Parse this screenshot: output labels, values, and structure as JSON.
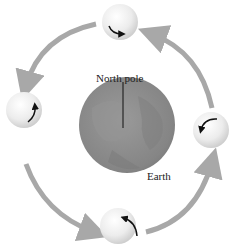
{
  "diagram": {
    "labels": {
      "north_pole": "North pole",
      "earth": "Earth"
    },
    "earth": {
      "color": "#8a8a8a",
      "center": [
        127,
        125
      ],
      "radius": 48
    },
    "moons": [
      {
        "position": "top",
        "center": [
          120,
          22
        ],
        "rotation_arrow": "counterclockwise"
      },
      {
        "position": "left",
        "center": [
          24,
          110
        ],
        "rotation_arrow": "counterclockwise"
      },
      {
        "position": "bottom",
        "center": [
          118,
          226
        ],
        "rotation_arrow": "counterclockwise"
      },
      {
        "position": "right",
        "center": [
          211,
          130
        ],
        "rotation_arrow": "counterclockwise"
      }
    ],
    "orbit_arrow_color": "#a8a8a8",
    "orbit_direction": "counterclockwise"
  }
}
